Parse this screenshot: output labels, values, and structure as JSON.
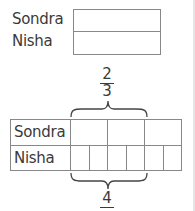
{
  "top_model": {
    "rows": [
      "Sondra",
      "Nisha"
    ]
  },
  "bar_model": {
    "fraction_label": {
      "numerator": "2",
      "denominator": "3"
    },
    "rows": [
      {
        "label": "Sondra",
        "parts": 3
      },
      {
        "label": "Nisha",
        "parts": 6
      }
    ],
    "answer_value": "4"
  }
}
